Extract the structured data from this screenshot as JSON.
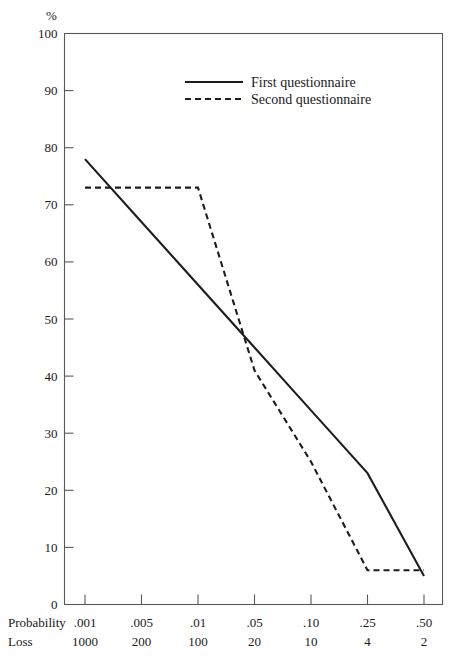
{
  "chart_data": {
    "type": "line",
    "title": "",
    "subtitle": "",
    "ylabel": "%",
    "ylim": [
      0,
      100
    ],
    "yticks": [
      0,
      10,
      20,
      30,
      40,
      50,
      60,
      70,
      80,
      90,
      100
    ],
    "ytick_labels": [
      "0",
      "10",
      "20",
      "30",
      "40",
      "50",
      "60",
      "70",
      "80",
      "90",
      "100"
    ],
    "grid": false,
    "legend_position": "top-center",
    "x_axis_rows": [
      {
        "name": "probability-row",
        "header": "Probability",
        "tick_labels": [
          ".001",
          ".005",
          ".01",
          ".05",
          ".10",
          ".25",
          ".50"
        ]
      },
      {
        "name": "loss-row",
        "header": "Loss",
        "tick_labels": [
          "1000",
          "200",
          "100",
          "20",
          "10",
          "4",
          "2"
        ]
      }
    ],
    "x_positions": [
      0,
      1,
      2,
      3,
      4,
      5,
      6
    ],
    "series": [
      {
        "name": "First questionnaire",
        "style": "solid",
        "color": "#1d1d1d",
        "x": [
          0,
          1,
          2,
          3,
          4,
          5,
          6
        ],
        "values": [
          78,
          67,
          56,
          45,
          34,
          23,
          5
        ]
      },
      {
        "name": "Second questionnaire",
        "style": "dashed",
        "color": "#1d1d1d",
        "x": [
          0,
          1,
          2,
          3,
          4,
          5,
          6
        ],
        "values": [
          73,
          73,
          73,
          41,
          25,
          6,
          6
        ]
      }
    ],
    "annotations": []
  },
  "legend": {
    "entries": [
      {
        "label": "First questionnaire",
        "style": "solid"
      },
      {
        "label": "Second questionnaire",
        "style": "dashed"
      }
    ]
  },
  "axis": {
    "y_unit": "%"
  }
}
